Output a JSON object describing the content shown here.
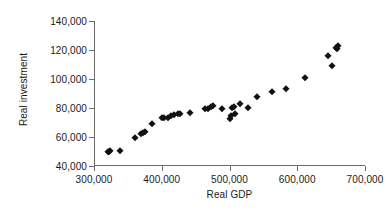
{
  "chart_data": {
    "type": "scatter",
    "title": "",
    "xlabel": "Real GDP",
    "ylabel": "Real investment",
    "xlim": [
      300000,
      700000
    ],
    "ylim": [
      40000,
      140000
    ],
    "xticks": [
      300000,
      400000,
      500000,
      600000,
      700000
    ],
    "yticks": [
      40000,
      60000,
      80000,
      100000,
      120000,
      140000
    ],
    "xtick_labels": [
      "300,000",
      "400,000",
      "500,000",
      "600,000",
      "700,000"
    ],
    "ytick_labels": [
      "40,000",
      "60,000",
      "80,000",
      "100,000",
      "120,000",
      "140,000"
    ],
    "grid": false,
    "legend": false,
    "marker": "diamond",
    "marker_color": "#111111",
    "axis_color": "#6b6b6b",
    "background": "#ffffff",
    "series": [
      {
        "name": "Real investment vs Real GDP",
        "points": [
          [
            320000,
            49500
          ],
          [
            322000,
            49800
          ],
          [
            324000,
            50200
          ],
          [
            338000,
            50600
          ],
          [
            360000,
            59000
          ],
          [
            369000,
            62200
          ],
          [
            372000,
            62800
          ],
          [
            375000,
            63300
          ],
          [
            385000,
            69000
          ],
          [
            400000,
            73000
          ],
          [
            403000,
            73200
          ],
          [
            409000,
            73300
          ],
          [
            414000,
            74800
          ],
          [
            418000,
            75300
          ],
          [
            424000,
            76000
          ],
          [
            427000,
            76100
          ],
          [
            441000,
            76600
          ],
          [
            464000,
            79200
          ],
          [
            468000,
            79400
          ],
          [
            473000,
            81000
          ],
          [
            476000,
            81400
          ],
          [
            489000,
            79000
          ],
          [
            500000,
            72200
          ],
          [
            502000,
            74500
          ],
          [
            504000,
            80300
          ],
          [
            506000,
            80900
          ],
          [
            508000,
            76200
          ],
          [
            516000,
            82900
          ],
          [
            527000,
            80200
          ],
          [
            541000,
            87300
          ],
          [
            562000,
            91000
          ],
          [
            584000,
            93000
          ],
          [
            611000,
            101000
          ],
          [
            645000,
            116000
          ],
          [
            651000,
            109000
          ],
          [
            657000,
            121500
          ],
          [
            659000,
            120400
          ],
          [
            660000,
            122800
          ]
        ]
      }
    ]
  }
}
